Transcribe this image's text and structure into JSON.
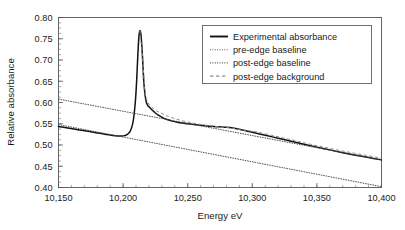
{
  "chart_data": {
    "type": "line",
    "title": "",
    "xlabel": "Energy eV",
    "ylabel": "Relative absorbance",
    "xlim": [
      10150,
      10400
    ],
    "ylim": [
      0.4,
      0.8
    ],
    "grid": false,
    "legend_position": "top-right",
    "x_ticks": [
      10150,
      10200,
      10250,
      10300,
      10350,
      10400
    ],
    "x_tick_labels": [
      "10,150",
      "10,200",
      "10,250",
      "10,300",
      "10,350",
      "10,400"
    ],
    "x_minor_tick_step": 10,
    "y_ticks": [
      0.4,
      0.45,
      0.5,
      0.55,
      0.6,
      0.65,
      0.7,
      0.75,
      0.8
    ],
    "y_tick_labels": [
      "0.40",
      "0.45",
      "0.50",
      "0.55",
      "0.60",
      "0.65",
      "0.70",
      "0.75",
      "0.80"
    ],
    "y_minor_tick_step": 0.0125,
    "series": [
      {
        "name": "Experimental absorbance",
        "style": "solid",
        "color": "#121212",
        "x": [
          10150,
          10156,
          10162,
          10168,
          10174,
          10180,
          10186,
          10190,
          10194,
          10197,
          10199,
          10201,
          10203,
          10205,
          10206,
          10207,
          10208,
          10209,
          10209.8,
          10210.5,
          10211,
          10211.5,
          10212,
          10212.5,
          10213,
          10213.5,
          10214,
          10214.5,
          10215,
          10215.5,
          10216,
          10217,
          10218,
          10219,
          10220,
          10221,
          10222,
          10224,
          10226,
          10228,
          10231,
          10234,
          10238,
          10242,
          10246,
          10250,
          10255,
          10260,
          10265,
          10270,
          10275,
          10280,
          10285,
          10290,
          10295,
          10300,
          10310,
          10320,
          10330,
          10340,
          10350,
          10360,
          10370,
          10380,
          10390,
          10400
        ],
        "y": [
          0.5435,
          0.5405,
          0.5375,
          0.5345,
          0.5315,
          0.5285,
          0.5255,
          0.5235,
          0.5219,
          0.5212,
          0.5212,
          0.522,
          0.5245,
          0.53,
          0.536,
          0.545,
          0.56,
          0.586,
          0.615,
          0.652,
          0.685,
          0.718,
          0.745,
          0.7625,
          0.769,
          0.766,
          0.754,
          0.734,
          0.708,
          0.679,
          0.65,
          0.618,
          0.6005,
          0.5935,
          0.59,
          0.5868,
          0.5835,
          0.578,
          0.573,
          0.569,
          0.564,
          0.56,
          0.5562,
          0.5535,
          0.5515,
          0.55,
          0.548,
          0.5462,
          0.5448,
          0.5437,
          0.5427,
          0.5418,
          0.54,
          0.537,
          0.5335,
          0.53,
          0.523,
          0.516,
          0.509,
          0.502,
          0.495,
          0.4885,
          0.482,
          0.476,
          0.4705,
          0.465
        ]
      },
      {
        "name": "pre-edge baseline",
        "style": "dotted",
        "color": "#4a4a4a",
        "x": [
          10150,
          10400
        ],
        "y": [
          0.548,
          0.402
        ]
      },
      {
        "name": "post-edge baseline",
        "style": "dotted",
        "color": "#4a4a4a",
        "x": [
          10150,
          10400
        ],
        "y": [
          0.608,
          0.465
        ]
      },
      {
        "name": "post-edge background",
        "style": "dashed",
        "color": "#8d8d8d",
        "x": [
          10213,
          10215,
          10217,
          10219,
          10222,
          10226,
          10230,
          10235,
          10240,
          10246,
          10252,
          10258,
          10265,
          10272,
          10280,
          10288,
          10296,
          10305,
          10315,
          10325,
          10335,
          10345,
          10355,
          10365,
          10375,
          10385,
          10395,
          10400
        ],
        "y": [
          0.769,
          0.708,
          0.625,
          0.602,
          0.5895,
          0.58,
          0.574,
          0.5672,
          0.5622,
          0.557,
          0.5528,
          0.5495,
          0.5462,
          0.5437,
          0.5412,
          0.5378,
          0.534,
          0.5298,
          0.5228,
          0.5158,
          0.5088,
          0.5018,
          0.4952,
          0.4888,
          0.4828,
          0.4772,
          0.4718,
          0.469
        ]
      }
    ],
    "legend_entries": [
      {
        "label": "Experimental absorbance",
        "style": "solid"
      },
      {
        "label": "pre-edge baseline",
        "style": "dotted"
      },
      {
        "label": "post-edge baseline",
        "style": "dotted"
      },
      {
        "label": "post-edge background",
        "style": "dashed"
      }
    ]
  }
}
